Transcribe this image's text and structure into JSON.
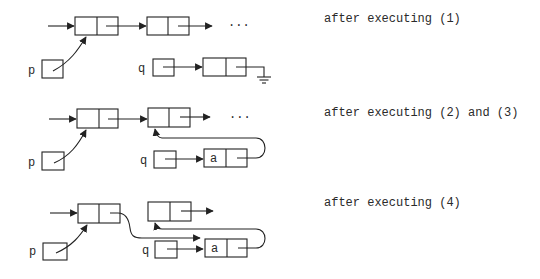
{
  "captions": [
    "after executing (1)",
    "after executing (2) and (3)",
    "after executing (4)"
  ],
  "labels": {
    "p": "p",
    "q": "q",
    "a": "a",
    "ellipsis": "···"
  },
  "colors": {
    "ink": "#222222",
    "background": "#ffffff"
  },
  "states": [
    {
      "step": "1",
      "description": "p points to list head; q points to a new node whose link is nil (ground symbol)"
    },
    {
      "step": "2-3",
      "description": "new node stores 'a' and its link points to second list node"
    },
    {
      "step": "4",
      "description": "first node's link now points to new node 'a'"
    }
  ]
}
